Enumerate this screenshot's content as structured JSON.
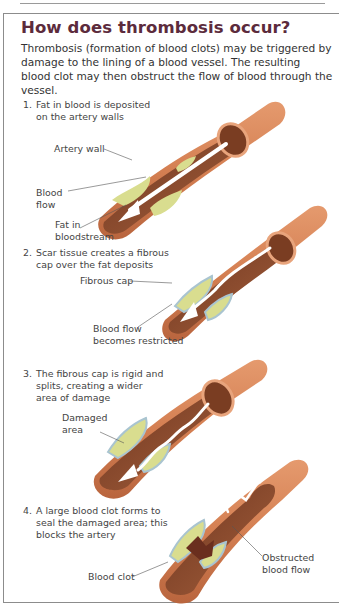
{
  "title": "How does thrombosis occur?",
  "intro": "Thrombosis (formation of blood clots) may be triggered by damage to the lining of a blood vessel. The resulting blood clot may then obstruct the flow of blood through the vessel.",
  "colors": {
    "title": "#5c2b3c",
    "artery_outer": "#d9875a",
    "artery_inner": "#8a4a2c",
    "fat_deposit": "#d8dc8c",
    "fibrous_cap": "#a9c4d0",
    "blood_clot": "#6a2e1e",
    "flow_arrow": "#ffffff"
  },
  "steps": [
    {
      "number": "1.",
      "line1": "Fat in blood is deposited",
      "line2": "on the artery walls",
      "labels": [
        {
          "text": "Artery wall"
        },
        {
          "line1": "Blood",
          "line2": "flow"
        },
        {
          "line1": "Fat in",
          "line2": "bloodstream"
        }
      ]
    },
    {
      "number": "2.",
      "line1": "Scar tissue creates a fibrous",
      "line2": "cap over the fat deposits",
      "labels": [
        {
          "text": "Fibrous cap"
        },
        {
          "line1": "Blood flow",
          "line2": "becomes restricted"
        }
      ]
    },
    {
      "number": "3.",
      "line1": "The fibrous cap is rigid and",
      "line2": "splits, creating a wider",
      "line3": "area of damage",
      "labels": [
        {
          "line1": "Damaged",
          "line2": "area"
        }
      ]
    },
    {
      "number": "4.",
      "line1": "A large blood clot forms to",
      "line2": "seal the damaged area; this",
      "line3": "blocks the artery",
      "labels": [
        {
          "text": "Blood clot"
        },
        {
          "line1": "Obstructed",
          "line2": "blood flow"
        }
      ]
    }
  ]
}
